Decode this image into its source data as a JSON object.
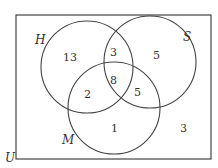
{
  "diagram": {
    "type": "venn",
    "universe_label": "U",
    "sets": [
      {
        "label": "H"
      },
      {
        "label": "S"
      },
      {
        "label": "M"
      }
    ],
    "regions": {
      "H_only": "13",
      "H_and_S_only": "3",
      "S_only": "5",
      "H_S_M": "8",
      "H_and_M_only": "2",
      "S_and_M_only": "5",
      "M_only": "1",
      "outside": "3"
    }
  }
}
